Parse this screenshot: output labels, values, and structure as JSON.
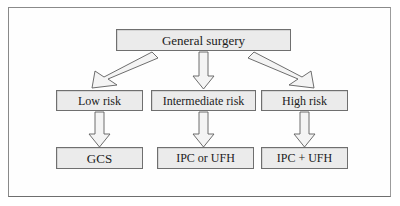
{
  "figure": {
    "frame_border_color": "#8a8a8a",
    "background_color": "#ffffff",
    "node_fill_color": "#ebebeb",
    "node_border_color": "#6f6f6f",
    "arrow_fill_color": "#f4f4f4",
    "arrow_border_color": "#5d5d5d"
  },
  "diagram": {
    "type": "flowchart",
    "orientation": "top-down",
    "levels": 3,
    "root": {
      "id": "general-surgery",
      "label": "General surgery"
    },
    "risk_levels": [
      {
        "id": "low-risk",
        "label": "Low risk"
      },
      {
        "id": "intermediate-risk",
        "label": "Intermediate risk"
      },
      {
        "id": "high-risk",
        "label": "High risk"
      }
    ],
    "treatments": [
      {
        "id": "gcs",
        "label": "GCS"
      },
      {
        "id": "ipc-or-ufh",
        "label": "IPC or UFH"
      },
      {
        "id": "ipc-plus-ufh",
        "label": "IPC + UFH"
      }
    ],
    "edges": [
      {
        "from": "general-surgery",
        "to": "low-risk",
        "style": "block-arrow",
        "direction": "down-left"
      },
      {
        "from": "general-surgery",
        "to": "intermediate-risk",
        "style": "block-arrow",
        "direction": "down"
      },
      {
        "from": "general-surgery",
        "to": "high-risk",
        "style": "block-arrow",
        "direction": "down-right"
      },
      {
        "from": "low-risk",
        "to": "gcs",
        "style": "block-arrow",
        "direction": "down"
      },
      {
        "from": "intermediate-risk",
        "to": "ipc-or-ufh",
        "style": "block-arrow",
        "direction": "down"
      },
      {
        "from": "high-risk",
        "to": "ipc-plus-ufh",
        "style": "block-arrow",
        "direction": "down"
      }
    ]
  }
}
